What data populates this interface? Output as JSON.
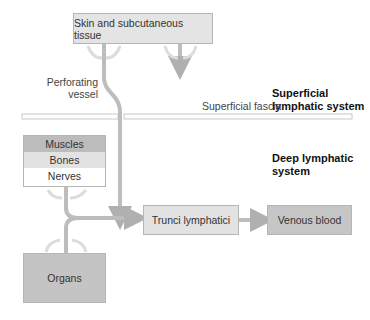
{
  "nodes": {
    "skin": "Skin and subcutaneous tissue",
    "muscles": "Muscles",
    "bones": "Bones",
    "nerves": "Nerves",
    "organs": "Organs",
    "trunci": "Trunci lymphatici",
    "venous": "Venous blood"
  },
  "labels": {
    "perforating_line1": "Perforating",
    "perforating_line2": "vessel",
    "fascia": "Superficial fascia",
    "superficial_line1": "Superficial",
    "superficial_line2": "lymphatic system",
    "deep_line1": "Deep lymphatic",
    "deep_line2": "system"
  },
  "colors": {
    "arrow": "#bdbdbd",
    "skin_box": "#e4e4e4",
    "muscles_row": "#bcbcbc",
    "bones_row": "#e2e2e2",
    "nerves_row": "#ffffff",
    "organs_box": "#c4c4c4",
    "trunci_box": "#e2e2e2",
    "venous_box": "#c6c6c6"
  }
}
